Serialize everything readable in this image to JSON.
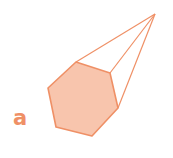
{
  "figure": {
    "label": "a",
    "shape": "hexagonal-pyramid",
    "colors": {
      "stroke": "#ef9066",
      "face_fill": "#f8c5ad",
      "label": "#ef9066"
    },
    "apex": [
      155,
      14
    ],
    "base_vertices": [
      [
        76,
        62
      ],
      [
        110,
        73
      ],
      [
        118,
        108
      ],
      [
        92,
        136
      ],
      [
        56,
        127
      ],
      [
        48,
        88
      ]
    ]
  }
}
